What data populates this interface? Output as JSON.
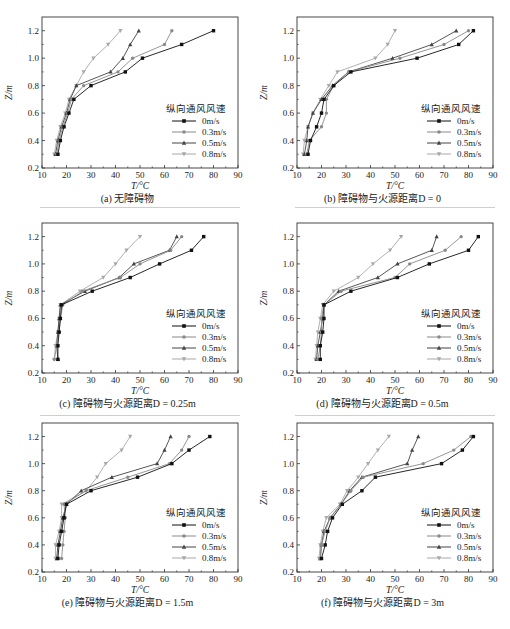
{
  "figure": {
    "legend_title": "纵向通风风速",
    "xlabel": "T/°C",
    "ylabel": "Z/m"
  },
  "style": {
    "series_colors": [
      "#111111",
      "#8a8a8a",
      "#444444",
      "#a8a8a8"
    ],
    "series_markers": [
      "square",
      "circle",
      "triangle-up",
      "triangle-down"
    ]
  },
  "chart_data": [
    {
      "type": "line",
      "id": "a",
      "caption": "(a) 无障碍物",
      "xlabel": "T/°C",
      "ylabel": "Z/m",
      "xlim": [
        10,
        90
      ],
      "ylim": [
        0.2,
        1.3
      ],
      "xticks": [
        10,
        20,
        30,
        40,
        50,
        60,
        70,
        80,
        90
      ],
      "yticks": [
        0.2,
        0.4,
        0.6,
        0.8,
        1.0,
        1.2
      ],
      "legend_title": "纵向通风风速",
      "legend_position": "lower right",
      "grid": false,
      "y": [
        0.3,
        0.4,
        0.5,
        0.6,
        0.7,
        0.8,
        0.9,
        1.0,
        1.1,
        1.2
      ],
      "series": [
        {
          "name": "0m/s",
          "values": [
            16.5,
            17.5,
            19,
            21,
            23,
            30,
            44,
            51,
            67,
            80
          ]
        },
        {
          "name": "0.3m/s",
          "values": [
            16,
            17,
            18.5,
            20.5,
            22,
            27,
            41,
            47,
            60,
            63
          ]
        },
        {
          "name": "0.5m/s",
          "values": [
            15.5,
            16.5,
            18,
            20,
            21.5,
            24,
            38,
            43,
            46,
            49.5
          ]
        },
        {
          "name": "0.8m/s",
          "values": [
            15,
            16,
            17.5,
            19.5,
            21,
            24,
            27,
            31,
            37,
            42
          ]
        }
      ]
    },
    {
      "type": "line",
      "id": "b",
      "caption": "(b) 障碍物与火源距离D = 0",
      "xlabel": "T/°C",
      "ylabel": "Z/m",
      "xlim": [
        10,
        90
      ],
      "ylim": [
        0.2,
        1.3
      ],
      "xticks": [
        10,
        20,
        30,
        40,
        50,
        60,
        70,
        80,
        90
      ],
      "yticks": [
        0.2,
        0.4,
        0.6,
        0.8,
        1.0,
        1.2
      ],
      "legend_title": "纵向通风风速",
      "legend_position": "lower right",
      "grid": false,
      "y": [
        0.3,
        0.4,
        0.5,
        0.6,
        0.7,
        0.8,
        0.9,
        1.0,
        1.1,
        1.2
      ],
      "series": [
        {
          "name": "0m/s",
          "values": [
            14.5,
            15.5,
            18,
            20,
            21,
            25,
            32,
            59,
            76,
            82
          ]
        },
        {
          "name": "0.3m/s",
          "values": [
            14,
            15,
            20,
            22,
            22,
            25,
            31,
            52,
            70,
            80
          ]
        },
        {
          "name": "0.5m/s",
          "values": [
            13,
            14,
            14.5,
            16.5,
            20,
            24.5,
            31,
            49,
            65,
            75
          ]
        },
        {
          "name": "0.8m/s",
          "values": [
            12.5,
            13,
            14.5,
            16.5,
            19.5,
            23,
            26.5,
            42,
            47,
            50
          ]
        }
      ]
    },
    {
      "type": "line",
      "id": "c",
      "caption": "(c) 障碍物与火源距离D = 0.25m",
      "xlabel": "T/°C",
      "ylabel": "Z/m",
      "xlim": [
        10,
        90
      ],
      "ylim": [
        0.2,
        1.3
      ],
      "xticks": [
        10,
        20,
        30,
        40,
        50,
        60,
        70,
        80,
        90
      ],
      "yticks": [
        0.2,
        0.4,
        0.6,
        0.8,
        1.0,
        1.2
      ],
      "legend_title": "纵向通风风速",
      "legend_position": "lower right",
      "grid": false,
      "y": [
        0.3,
        0.4,
        0.5,
        0.6,
        0.7,
        0.8,
        0.9,
        1.0,
        1.1,
        1.2
      ],
      "series": [
        {
          "name": "0m/s",
          "values": [
            16.5,
            16.5,
            17,
            17.5,
            18,
            30.5,
            46,
            58,
            71,
            76
          ]
        },
        {
          "name": "0.3m/s",
          "values": [
            15,
            16,
            17,
            17.5,
            18.5,
            26.5,
            42,
            50,
            62.5,
            67
          ]
        },
        {
          "name": "0.5m/s",
          "values": [
            16.5,
            16,
            16.5,
            17,
            17.5,
            27.5,
            41.5,
            47.5,
            62,
            65
          ]
        },
        {
          "name": "0.8m/s",
          "values": [
            15,
            15.5,
            16.5,
            17,
            17.5,
            25.5,
            35,
            40,
            44.5,
            50
          ]
        }
      ]
    },
    {
      "type": "line",
      "id": "d",
      "caption": "(d) 障碍物与火源距离D = 0.5m",
      "xlabel": "T/°C",
      "ylabel": "Z/m",
      "xlim": [
        10,
        90
      ],
      "ylim": [
        0.2,
        1.3
      ],
      "xticks": [
        10,
        20,
        30,
        40,
        50,
        60,
        70,
        80,
        90
      ],
      "yticks": [
        0.2,
        0.4,
        0.6,
        0.8,
        1.0,
        1.2
      ],
      "legend_title": "纵向通风风速",
      "legend_position": "lower right",
      "grid": false,
      "y": [
        0.3,
        0.4,
        0.5,
        0.6,
        0.7,
        0.8,
        0.9,
        1.0,
        1.1,
        1.2
      ],
      "series": [
        {
          "name": "0m/s",
          "values": [
            19.5,
            19.5,
            20.5,
            21,
            21,
            32,
            51,
            64,
            80,
            84
          ]
        },
        {
          "name": "0.3m/s",
          "values": [
            18.5,
            19.5,
            20,
            20,
            21,
            28,
            50,
            56,
            70.5,
            77
          ]
        },
        {
          "name": "0.5m/s",
          "values": [
            18,
            18.5,
            19.5,
            20.5,
            21,
            27,
            43,
            51,
            65,
            67
          ]
        },
        {
          "name": "0.8m/s",
          "values": [
            17.5,
            18,
            18.5,
            19.5,
            20.5,
            25,
            35,
            41,
            48,
            52.5
          ]
        }
      ]
    },
    {
      "type": "line",
      "id": "e",
      "caption": "(e) 障碍物与火源距离D = 1.5m",
      "xlabel": "T/°C",
      "ylabel": "Z/m",
      "xlim": [
        10,
        90
      ],
      "ylim": [
        0.2,
        1.3
      ],
      "xticks": [
        10,
        20,
        30,
        40,
        50,
        60,
        70,
        80,
        90
      ],
      "yticks": [
        0.2,
        0.4,
        0.6,
        0.8,
        1.0,
        1.2
      ],
      "legend_title": "纵向通风风速",
      "legend_position": "lower right",
      "grid": false,
      "y": [
        0.3,
        0.4,
        0.5,
        0.6,
        0.7,
        0.8,
        0.9,
        1.0,
        1.1,
        1.2
      ],
      "series": [
        {
          "name": "0m/s",
          "values": [
            16.5,
            17,
            18,
            19,
            20,
            30,
            49,
            63,
            70,
            78.5
          ]
        },
        {
          "name": "0.3m/s",
          "values": [
            18,
            18.5,
            19,
            19.5,
            19,
            28,
            45,
            62,
            67,
            70
          ]
        },
        {
          "name": "0.5m/s",
          "values": [
            16,
            16.5,
            17.5,
            18.5,
            20,
            26,
            38.5,
            57,
            60,
            62.5
          ]
        },
        {
          "name": "0.8m/s",
          "values": [
            15.5,
            15.5,
            17,
            18,
            18,
            28,
            32.5,
            36,
            42.5,
            46
          ]
        }
      ]
    },
    {
      "type": "line",
      "id": "f",
      "caption": "(f) 障碍物与火源距离D = 3m",
      "xlabel": "T/°C",
      "ylabel": "Z/m",
      "xlim": [
        10,
        90
      ],
      "ylim": [
        0.2,
        1.3
      ],
      "xticks": [
        10,
        20,
        30,
        40,
        50,
        60,
        70,
        80,
        90
      ],
      "yticks": [
        0.2,
        0.4,
        0.6,
        0.8,
        1.0,
        1.2
      ],
      "legend_title": "纵向通风风速",
      "legend_position": "lower right",
      "grid": false,
      "y": [
        0.3,
        0.4,
        0.5,
        0.6,
        0.7,
        0.8,
        0.9,
        1.0,
        1.1,
        1.2
      ],
      "series": [
        {
          "name": "0m/s",
          "values": [
            20,
            21.5,
            22.5,
            24.5,
            28.5,
            36.5,
            42,
            69,
            77.5,
            82
          ]
        },
        {
          "name": "0.3m/s",
          "values": [
            19.5,
            20,
            21.5,
            23.5,
            28,
            32,
            37,
            61.5,
            74,
            81
          ]
        },
        {
          "name": "0.5m/s",
          "values": [
            19.5,
            20,
            21,
            23.5,
            28,
            31.5,
            36.5,
            55,
            57,
            59.5
          ]
        },
        {
          "name": "0.8m/s",
          "values": [
            19,
            19.5,
            20.5,
            22,
            27.5,
            30.5,
            35,
            39,
            43,
            47.5
          ]
        }
      ]
    }
  ]
}
